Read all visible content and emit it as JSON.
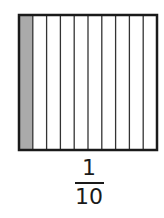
{
  "diagram": {
    "total_parts": 10,
    "shaded_parts": 1,
    "shaded_index": 0,
    "colors": {
      "outline": "#1a1a1a",
      "divider": "#333333",
      "shaded": "#aaaaaa",
      "unshaded": "#ffffff"
    }
  },
  "fraction": {
    "numerator": "1",
    "denominator": "10"
  }
}
